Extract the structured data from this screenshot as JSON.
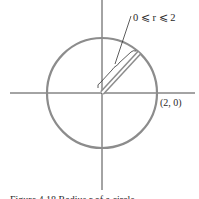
{
  "figure": {
    "range_label": "0 ⩽ r ⩽ 2",
    "point_label": "(2, 0)",
    "caption": "Figure 4.18  Radius r of a circle"
  },
  "colors": {
    "axis": "#333333",
    "circle": "#8c8c8c",
    "segment": "#8c8c8c",
    "text": "#2a2a2a"
  }
}
